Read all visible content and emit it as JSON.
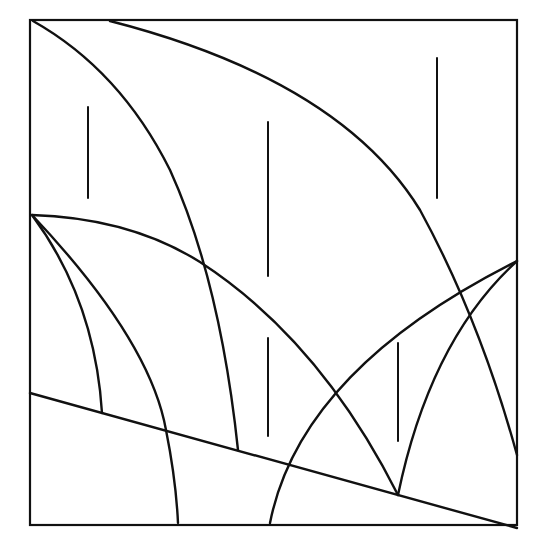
{
  "diagram": {
    "title": "",
    "type": "phase-boundary-sketch",
    "colors": {
      "background": "#ffffff",
      "stroke": "#111111"
    },
    "frame": {
      "x": 30,
      "y": 20,
      "width": 487,
      "height": 505,
      "stroke_width": 2.2
    },
    "curves": [
      {
        "id": "curve-a",
        "d": "M 33 21 Q 120 70 170 170 Q 220 280 238 450"
      },
      {
        "id": "curve-b",
        "d": "M 110 21 Q 340 80 420 210 Q 480 320 517 455"
      },
      {
        "id": "curve-c",
        "d": "M 32 215 Q 130 218 200 262 Q 320 340 398 495"
      },
      {
        "id": "curve-d",
        "d": "M 32 215 Q 95 300 102 413"
      },
      {
        "id": "curve-e",
        "d": "M 32 215 Q 150 340 166 430 Q 176 480 178 523"
      },
      {
        "id": "curve-f",
        "d": "M 30 393 L 517 528"
      },
      {
        "id": "curve-g",
        "d": "M 270 523 Q 300 370 517 261"
      },
      {
        "id": "curve-h",
        "d": "M 398 495 Q 430 340 517 261"
      }
    ],
    "arrows": [
      {
        "id": "arrow-1",
        "x": 88,
        "y1": 107,
        "y2": 198
      },
      {
        "id": "arrow-2",
        "x": 268,
        "y1": 122,
        "y2": 276
      },
      {
        "id": "arrow-3",
        "x": 437,
        "y1": 58,
        "y2": 198
      },
      {
        "id": "arrow-4",
        "x": 268,
        "y1": 338,
        "y2": 436
      },
      {
        "id": "arrow-5",
        "x": 398,
        "y1": 343,
        "y2": 441
      }
    ],
    "stroke_width": 2.4,
    "arrow_stroke_width": 2
  }
}
